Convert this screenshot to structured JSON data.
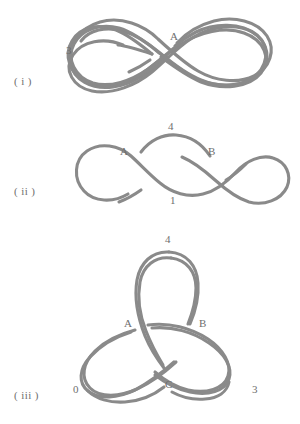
{
  "document": {
    "type": "knot-diagram-figure-sheet",
    "stroke_color": "#8a8a8a",
    "text_color": "#6e6e6e",
    "background_color": "#ffffff"
  },
  "figures": [
    {
      "id": "i",
      "caption": "( i )",
      "description": "Figure-eight shaped closed curve with one crossing; one strand is broken at the crossing indicating it passes under.",
      "labels": {
        "crossing": "A",
        "region": "3"
      }
    },
    {
      "id": "ii",
      "caption": "( ii )",
      "description": "Doubled figure-eight curve with two crossings labelled A and B, upper region 4 and lower region 1.",
      "labels": {
        "crossing_left": "A",
        "crossing_right": "B",
        "region_top": "4",
        "region_bottom": "1"
      }
    },
    {
      "id": "iii",
      "caption": "( iii )",
      "description": "Trefoil knot drawn with three-fold symmetry, three crossings labelled A, B and C, with regions 4, 0 and 3.",
      "labels": {
        "crossing_left": "A",
        "crossing_right": "B",
        "crossing_bottom": "C",
        "region_top": "4",
        "region_left": "0",
        "region_right": "3"
      }
    }
  ]
}
